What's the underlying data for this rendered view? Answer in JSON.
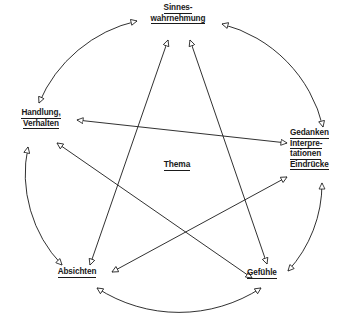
{
  "diagram": {
    "title": "Thema",
    "center": {
      "id": "thema",
      "label": "Thema",
      "lines": [
        "Thema"
      ]
    },
    "nodes": [
      {
        "id": "sinneswahrnehmung",
        "label": "Sinneswahrnehmung",
        "lines": [
          "Sinnes-",
          "wahrnehmung"
        ],
        "position": "top"
      },
      {
        "id": "handlung-verhalten",
        "label": "Handlung, Verhalten",
        "lines": [
          "Handlung,",
          "Verhalten"
        ],
        "position": "left"
      },
      {
        "id": "gedanken-interpretationen-eindruecke",
        "label": "Gedanken Interpretationen Eindrücke",
        "lines": [
          "Gedanken",
          "Interpre-",
          "tationen",
          "Eindrücke"
        ],
        "position": "right"
      },
      {
        "id": "absichten",
        "label": "Absichten",
        "lines": [
          "Absichten"
        ],
        "position": "bottom-left"
      },
      {
        "id": "gefuehle",
        "label": "Gefühle",
        "lines": [
          "Gefühle"
        ],
        "position": "bottom-right"
      }
    ],
    "edges": [
      {
        "id": "arc-handlung-sinneswahrnehmung",
        "from": "handlung-verhalten",
        "to": "sinneswahrnehmung",
        "style": "arc",
        "arrows": "both"
      },
      {
        "id": "arc-sinneswahrnehmung-gedanken",
        "from": "sinneswahrnehmung",
        "to": "gedanken-interpretationen-eindruecke",
        "style": "arc",
        "arrows": "both"
      },
      {
        "id": "arc-gedanken-gefuehle",
        "from": "gedanken-interpretationen-eindruecke",
        "to": "gefuehle",
        "style": "arc",
        "arrows": "both"
      },
      {
        "id": "arc-gefuehle-absichten",
        "from": "gefuehle",
        "to": "absichten",
        "style": "arc",
        "arrows": "both"
      },
      {
        "id": "arc-absichten-handlung",
        "from": "absichten",
        "to": "handlung-verhalten",
        "style": "arc",
        "arrows": "both"
      },
      {
        "id": "chord-handlung-gedanken",
        "from": "handlung-verhalten",
        "to": "gedanken-interpretationen-eindruecke",
        "style": "chord",
        "arrows": "both"
      },
      {
        "id": "chord-sinneswahrnehmung-absichten",
        "from": "sinneswahrnehmung",
        "to": "absichten",
        "style": "chord",
        "arrows": "both"
      },
      {
        "id": "chord-sinneswahrnehmung-gefuehle",
        "from": "sinneswahrnehmung",
        "to": "gefuehle",
        "style": "chord",
        "arrows": "both"
      },
      {
        "id": "chord-handlung-gefuehle",
        "from": "handlung-verhalten",
        "to": "gefuehle",
        "style": "chord",
        "arrows": "both"
      },
      {
        "id": "chord-absichten-gedanken",
        "from": "absichten",
        "to": "gedanken-interpretationen-eindruecke",
        "style": "chord",
        "arrows": "both"
      }
    ],
    "colors": {
      "stroke": "#1a1a1a",
      "text": "#1a1a1a",
      "background": "#ffffff"
    }
  }
}
